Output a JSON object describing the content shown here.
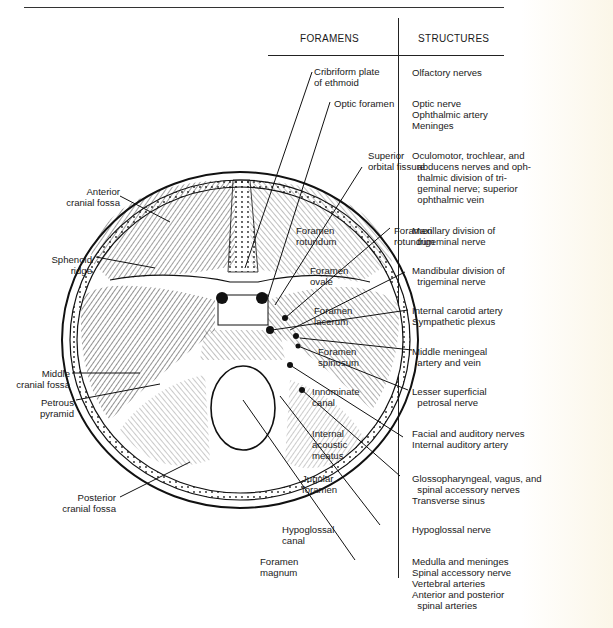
{
  "table": {
    "headers": {
      "foramens": "FORAMENS",
      "structures": "STRUCTURES"
    },
    "rows": [
      {
        "foramen": "Cribriform plate\nof ethmoid",
        "structures": "Olfactory nerves"
      },
      {
        "foramen": "Optic foramen",
        "structures": "Optic nerve\nOphthalmic artery\nMeninges"
      },
      {
        "foramen": "Superior\norbital fissure",
        "structures": "Oculomotor, trochlear, and\n  abducens nerves and oph-\n  thalmic division of tri-\n  geminal nerve; superior\n  ophthalmic vein"
      },
      {
        "foramen": "Foramen\nrotundum",
        "structures": "Maxillary division of\n  trigeminal nerve"
      },
      {
        "foramen": "Foramen\novale",
        "structures": "Mandibular division of\n  trigeminal nerve"
      },
      {
        "foramen": "Foramen\nlacerum",
        "structures": "Internal carotid artery\nSympathetic plexus"
      },
      {
        "foramen": "Foramen\nspinosum",
        "structures": "Middle meningeal\n  artery and vein"
      },
      {
        "foramen": "Innominate\ncanal",
        "structures": "Lesser superficial\n  petrosal nerve"
      },
      {
        "foramen": "Internal\nacoustic\nmeatus",
        "structures": "Facial and auditory nerves\nInternal auditory artery"
      },
      {
        "foramen": "Jugular\nforamen",
        "structures": "Glossopharyngeal, vagus, and\n  spinal accessory nerves\nTransverse sinus"
      },
      {
        "foramen": "Hypoglossal\ncanal",
        "structures": "Hypoglossal nerve"
      },
      {
        "foramen": "Foramen\nmagnum",
        "structures": "Medulla and meninges\nSpinal accessory nerve\nVertebral arteries\nAnterior and posterior\n  spinal arteries"
      }
    ]
  },
  "left_labels": [
    {
      "text": "Anterior\ncranial fossa"
    },
    {
      "text": "Sphenoid\nridge"
    },
    {
      "text": "Middle\ncranial fossa"
    },
    {
      "text": "Petrous\npyramid"
    },
    {
      "text": "Posterior\ncranial fossa"
    }
  ]
}
